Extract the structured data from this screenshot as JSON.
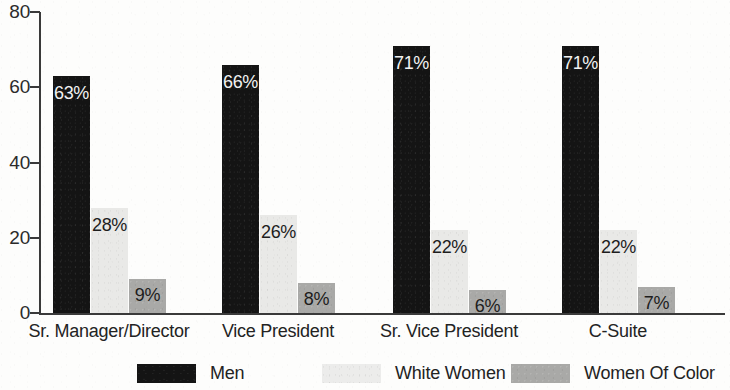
{
  "chart_data": {
    "type": "bar",
    "title": "",
    "subtitle": "",
    "xlabel": "",
    "ylabel": "",
    "ylim": [
      0,
      80
    ],
    "yticks": [
      0,
      20,
      40,
      60,
      80
    ],
    "ytick_labels": [
      "0",
      "20",
      "40",
      "60",
      "80"
    ],
    "grid": false,
    "legend_position": "bottom",
    "categories": [
      "Sr. Manager/Director",
      "Vice President",
      "Sr. Vice President",
      "C-Suite"
    ],
    "series": [
      {
        "name": "Men",
        "color": "#141414",
        "values": [
          63,
          66,
          71,
          71
        ],
        "labels": [
          "63%",
          "66%",
          "71%",
          "71%"
        ]
      },
      {
        "name": "White Women",
        "color": "#e9e9e7",
        "values": [
          28,
          26,
          22,
          22
        ],
        "labels": [
          "28%",
          "26%",
          "22%",
          "22%"
        ]
      },
      {
        "name": "Women Of Color",
        "color": "#a9a9a7",
        "values": [
          9,
          8,
          6,
          7
        ],
        "labels": [
          "9%",
          "8%",
          "6%",
          "7%"
        ]
      }
    ]
  },
  "legend": {
    "items": [
      {
        "label": "Men",
        "swatch": "men-swatch"
      },
      {
        "label": "White Women",
        "swatch": "white-women-swatch"
      },
      {
        "label": "Women Of Color",
        "swatch": "women-of-color-swatch"
      }
    ]
  },
  "axis": {
    "y_labels": [
      "80",
      "60",
      "40",
      "20",
      "0"
    ]
  }
}
